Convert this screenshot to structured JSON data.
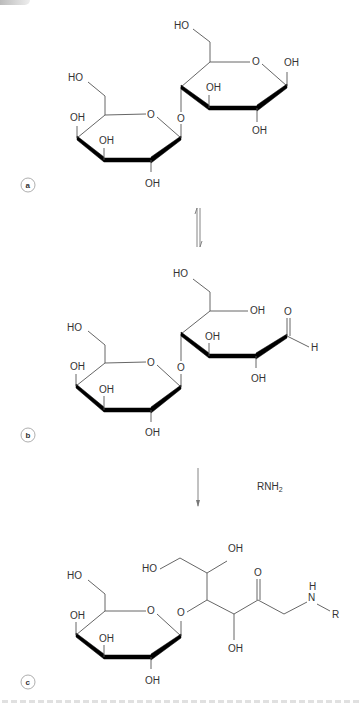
{
  "figure": {
    "panels": [
      {
        "id": "a",
        "label": "a",
        "description": "Lactose (cyclic form): galactose β(1→4) glucose",
        "labels": {
          "gal_c6_ho": "HO",
          "gal_c4_oh": "OH",
          "gal_c3_oh": "OH",
          "gal_c2_oh": "OH",
          "gal_ring_o": "O",
          "glycosidic_o": "O",
          "glc_c6_ho": "HO",
          "glc_ring_o": "O",
          "glc_c1_oh": "OH",
          "glc_c3_oh": "OH",
          "glc_c2_oh": "OH"
        }
      },
      {
        "id": "b",
        "label": "b",
        "description": "Lactose open-chain aldehyde form",
        "labels": {
          "gal_c6_ho": "HO",
          "gal_c4_oh": "OH",
          "gal_c3_oh": "OH",
          "gal_c2_oh": "OH",
          "gal_ring_o": "O",
          "glycosidic_o": "O",
          "glc_c6_ho": "HO",
          "glc_c5_oh": "OH",
          "glc_c3_oh": "OH",
          "glc_c2_oh": "OH",
          "aldehyde_o": "O",
          "aldehyde_h": "H"
        }
      },
      {
        "id": "c",
        "label": "c",
        "description": "Amadori product (lactulosyl-amine)",
        "labels": {
          "gal_c6_ho": "HO",
          "gal_c4_oh": "OH",
          "gal_c3_oh": "OH",
          "gal_c2_oh": "OH",
          "gal_ring_o": "O",
          "glycosidic_o": "O",
          "chain_ho": "HO",
          "chain_oh_top": "OH",
          "chain_oh_bottom": "OH",
          "ketone_o": "O",
          "amine_h": "H",
          "amine_n": "N",
          "amine_r": "R"
        }
      }
    ],
    "arrows": {
      "equilibrium": "⇌",
      "reaction_reagent": "RNH",
      "reaction_reagent_sub": "2"
    }
  }
}
